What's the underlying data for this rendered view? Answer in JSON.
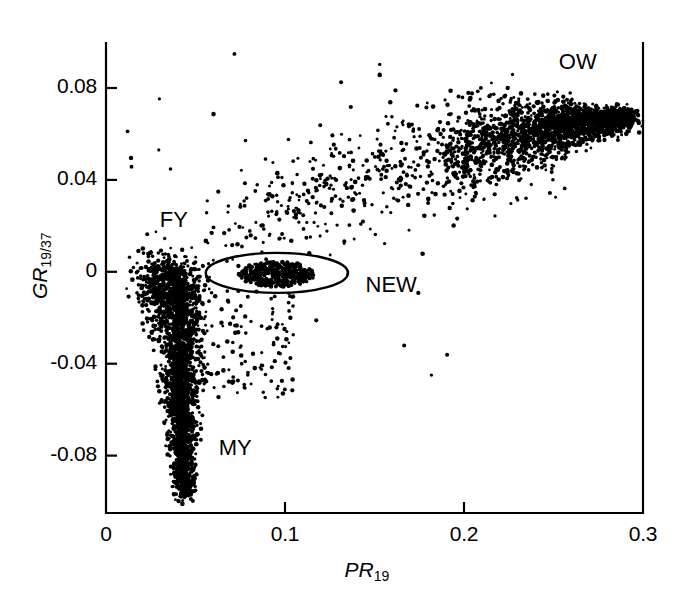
{
  "chart_data": {
    "type": "scatter",
    "title": "",
    "xlabel": "PR_19",
    "ylabel": "GR_19/37",
    "xlabel_main": "PR",
    "xlabel_sub": "19",
    "ylabel_main": "GR",
    "ylabel_sub": "19/37",
    "xlim": [
      0,
      0.3
    ],
    "ylim": [
      -0.105,
      0.1
    ],
    "grid": false,
    "legend": "none",
    "xticks": [
      0,
      0.1,
      0.2,
      0.3
    ],
    "xtick_labels": [
      "0",
      "0.1",
      "0.2",
      "0.3"
    ],
    "yticks": [
      0.08,
      0.04,
      0,
      -0.04,
      -0.08
    ],
    "ytick_labels": [
      "0.08",
      "0.04",
      "0",
      "-0.04",
      "-0.08"
    ],
    "point_color": "#000000",
    "point_size": 1.9,
    "annotations": [
      {
        "text": "OW",
        "x": 0.253,
        "y": 0.0905,
        "name": "annotation-ow",
        "desc": "open water cluster label"
      },
      {
        "text": "FY",
        "x": 0.03,
        "y": 0.0215,
        "name": "annotation-fy",
        "desc": "first-year ice cluster label"
      },
      {
        "text": "NEW",
        "x": 0.145,
        "y": -0.0065,
        "name": "annotation-new",
        "desc": "new ice cluster label"
      },
      {
        "text": "MY",
        "x": 0.063,
        "y": -0.0775,
        "name": "annotation-my",
        "desc": "multi-year ice cluster label"
      }
    ],
    "ellipse": {
      "name": "new-ice-ellipse",
      "cx": 0.0955,
      "cy": -0.0005,
      "rx": 0.0397,
      "ry": 0.0087,
      "stroke": "#000000",
      "stroke_width": 2.4,
      "fill": "none"
    },
    "clusters": [
      {
        "name": "MY",
        "label": "multi-year ice",
        "kind": "vertical-band",
        "n": 1750,
        "x_center": 0.0405,
        "x_spread": 0.0068,
        "y_min": -0.098,
        "y_max": 0.002,
        "x_narrow_at_bottom": true
      },
      {
        "name": "FY",
        "label": "first-year ice",
        "kind": "blob",
        "n": 340,
        "x_center": 0.031,
        "x_spread": 0.0075,
        "y_center": -0.006,
        "y_spread": 0.009
      },
      {
        "name": "NEW",
        "label": "new ice",
        "kind": "ellipse-fill",
        "n": 420,
        "x_center": 0.0955,
        "x_spread": 0.021,
        "y_center": -0.001,
        "y_spread": 0.0055
      },
      {
        "name": "ARC",
        "label": "mixture arc between new ice and open water",
        "kind": "arc",
        "n": 620,
        "x_min": 0.055,
        "x_max": 0.255,
        "y_at_xmin": 0.005,
        "y_at_xmax": 0.06,
        "scatter": 0.012
      },
      {
        "name": "OW",
        "label": "open water",
        "kind": "converging-band",
        "n": 1450,
        "x_min": 0.185,
        "x_max": 0.293,
        "y_at_xmin": 0.05,
        "y_at_xmax": 0.0665,
        "spread_at_xmin": 0.0135,
        "spread_at_xmax": 0.0022
      },
      {
        "name": "TAIL",
        "label": "sparse tail below new-ice ellipse",
        "kind": "sparse",
        "n": 130,
        "x_min": 0.048,
        "x_max": 0.105,
        "y_min": -0.055,
        "y_max": -0.008
      },
      {
        "name": "OUTLIERS",
        "label": "scattered outliers",
        "kind": "sparse",
        "n": 40,
        "x_min": 0.012,
        "x_max": 0.22,
        "y_min": -0.05,
        "y_max": 0.095
      }
    ]
  },
  "plot_geometry": {
    "left": 106,
    "right": 643,
    "top": 42,
    "bottom": 513,
    "frame_stroke": "#000000",
    "frame_width": 2.2,
    "tick_length": 11,
    "tick_width": 2.2
  }
}
